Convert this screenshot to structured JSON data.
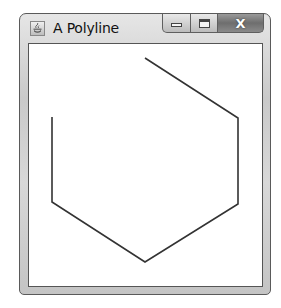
{
  "window": {
    "title": "A Polyline",
    "icon": "java-cup-icon",
    "controls": {
      "minimize": "minimize-icon",
      "maximize": "maximize-icon",
      "close": "close-icon",
      "close_glyph": "X"
    }
  },
  "canvas": {
    "stroke_color": "#333333",
    "stroke_width": 1.6,
    "polyline_points": [
      [
        145,
        58
      ],
      [
        238,
        118
      ],
      [
        238,
        204
      ],
      [
        145,
        262
      ],
      [
        52,
        202
      ],
      [
        52,
        117
      ]
    ]
  }
}
